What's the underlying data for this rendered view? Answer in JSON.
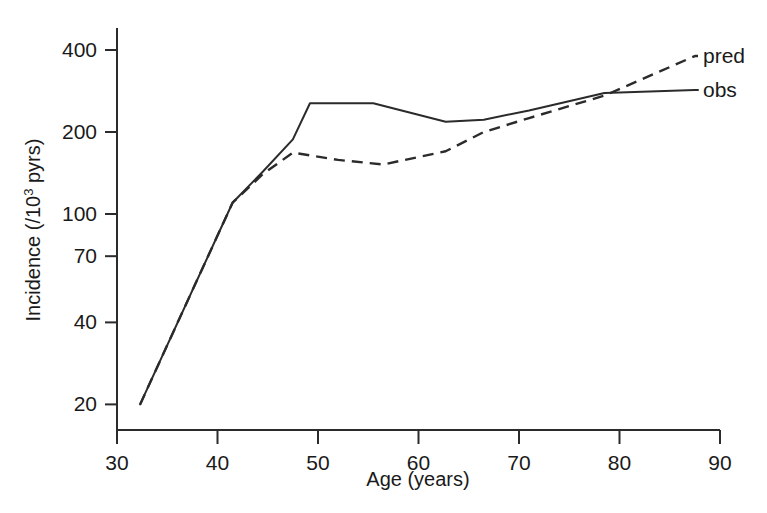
{
  "chart_data": {
    "type": "line",
    "title": "",
    "xlabel": "Age (years)",
    "ylabel": "Incidence (/10³ pyrs)",
    "ylabel_main": "Incidence (/10",
    "ylabel_sup": "3",
    "ylabel_tail": " pyrs)",
    "xscale": "linear",
    "yscale": "log",
    "xlim": [
      30,
      90
    ],
    "ylim": [
      15,
      520
    ],
    "grid": false,
    "legend_position": "right-inline",
    "xticks": [
      30,
      40,
      50,
      60,
      70,
      80,
      90
    ],
    "xtick_labels": [
      "30",
      "40",
      "50",
      "60",
      "70",
      "80",
      "90"
    ],
    "yticks": [
      20,
      40,
      70,
      100,
      200,
      400
    ],
    "ytick_labels": [
      "20",
      "40",
      "70",
      "100",
      "200",
      "400"
    ],
    "series": [
      {
        "name": "obs",
        "label": "obs",
        "style": "solid",
        "color": "#2b2b2b",
        "x": [
          32.3,
          41.5,
          44.5,
          47.5,
          49.2,
          55.5,
          62.7,
          66.5,
          71.0,
          78.5,
          87.5
        ],
        "values": [
          20,
          110,
          143,
          188,
          255,
          255,
          218,
          222,
          240,
          278,
          285
        ]
      },
      {
        "name": "pred",
        "label": "pred",
        "style": "dashed",
        "color": "#2b2b2b",
        "x": [
          32.3,
          41.5,
          44.5,
          47.5,
          52.0,
          56.5,
          62.7,
          66.5,
          71.0,
          78.5,
          87.5
        ],
        "values": [
          20,
          110,
          140,
          168,
          158,
          152,
          170,
          200,
          225,
          272,
          380
        ]
      }
    ],
    "legend": [
      {
        "name": "pred",
        "label": "pred",
        "style": "dashed"
      },
      {
        "name": "obs",
        "label": "obs",
        "style": "solid"
      }
    ]
  }
}
